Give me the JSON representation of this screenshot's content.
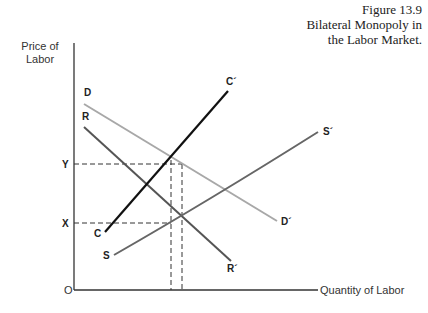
{
  "caption": {
    "figure": "Figure 13.9",
    "line1": "Bilateral Monopoly in",
    "line2": "the Labor Market."
  },
  "axes": {
    "y_label_line1": "Price of",
    "y_label_line2": "Labor",
    "x_label": "Quantity of Labor",
    "origin": "O"
  },
  "levels": {
    "y": "Y",
    "x": "X"
  },
  "curves": {
    "D": {
      "start": "D",
      "end": "D´",
      "color": "#a8a8a8"
    },
    "R": {
      "start": "R",
      "end": "R´",
      "color": "#555555"
    },
    "C": {
      "start": "C",
      "end": "C´",
      "color": "#111111"
    },
    "S": {
      "start": "S",
      "end": "S´",
      "color": "#666666"
    }
  }
}
